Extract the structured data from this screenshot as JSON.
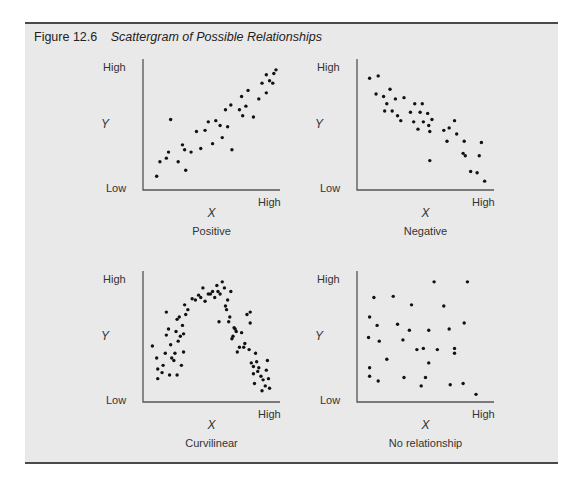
{
  "figure": {
    "number": "Figure 12.6",
    "title": "Scattergram of Possible Relationships",
    "colors": {
      "background": "#e9e9e9",
      "rule": "#4a4a4a",
      "dot": "#111111",
      "axis": "#555555"
    }
  },
  "chart_data": [
    {
      "type": "scatter",
      "title": "Positive",
      "xlabel": "X",
      "ylabel": "Y",
      "x_ticks": [
        "High"
      ],
      "y_ticks": [
        "High",
        "Low"
      ],
      "grid": false,
      "points": [
        [
          9,
          8
        ],
        [
          12,
          20
        ],
        [
          18,
          23
        ],
        [
          22,
          55
        ],
        [
          20,
          28
        ],
        [
          29,
          20
        ],
        [
          33,
          34
        ],
        [
          36,
          13
        ],
        [
          35,
          30
        ],
        [
          41,
          28
        ],
        [
          46,
          45
        ],
        [
          50,
          31
        ],
        [
          54,
          46
        ],
        [
          61,
          35
        ],
        [
          57,
          53
        ],
        [
          64,
          54
        ],
        [
          68,
          50
        ],
        [
          73,
          63
        ],
        [
          70,
          40
        ],
        [
          75,
          49
        ],
        [
          78,
          67
        ],
        [
          79,
          30
        ],
        [
          88,
          74
        ],
        [
          86,
          63
        ],
        [
          89,
          58
        ],
        [
          94,
          79
        ],
        [
          92,
          66
        ],
        [
          99,
          57
        ],
        [
          104,
          72
        ],
        [
          107,
          85
        ],
        [
          111,
          92
        ],
        [
          114,
          87
        ],
        [
          111,
          77
        ],
        [
          118,
          93
        ],
        [
          117,
          85
        ],
        [
          120,
          96
        ]
      ]
    },
    {
      "type": "scatter",
      "title": "Negative",
      "xlabel": "X",
      "ylabel": "Y",
      "x_ticks": [
        "High"
      ],
      "y_ticks": [
        "High",
        "Low"
      ],
      "grid": false,
      "points": [
        [
          8,
          89
        ],
        [
          16,
          91
        ],
        [
          14,
          76
        ],
        [
          21,
          74
        ],
        [
          27,
          80
        ],
        [
          32,
          72
        ],
        [
          24,
          68
        ],
        [
          22,
          62
        ],
        [
          40,
          73
        ],
        [
          29,
          62
        ],
        [
          34,
          58
        ],
        [
          37,
          54
        ],
        [
          50,
          68
        ],
        [
          46,
          61
        ],
        [
          57,
          68
        ],
        [
          49,
          53
        ],
        [
          55,
          61
        ],
        [
          58,
          53
        ],
        [
          53,
          47
        ],
        [
          62,
          60
        ],
        [
          66,
          55
        ],
        [
          63,
          50
        ],
        [
          64,
          45
        ],
        [
          77,
          46
        ],
        [
          82,
          48
        ],
        [
          87,
          54
        ],
        [
          80,
          37
        ],
        [
          89,
          43
        ],
        [
          96,
          37
        ],
        [
          95,
          27
        ],
        [
          97,
          25
        ],
        [
          112,
          36
        ],
        [
          110,
          25
        ],
        [
          64,
          21
        ],
        [
          102,
          12
        ],
        [
          108,
          11
        ],
        [
          115,
          4
        ]
      ]
    },
    {
      "type": "scatter",
      "title": "Curvilinear",
      "xlabel": "X",
      "ylabel": "Y",
      "x_ticks": [
        "High"
      ],
      "y_ticks": [
        "High",
        "Low"
      ],
      "grid": false,
      "points": [
        [
          5,
          43
        ],
        [
          9,
          33
        ],
        [
          10,
          16
        ],
        [
          10,
          24
        ],
        [
          14,
          21
        ],
        [
          15,
          27
        ],
        [
          17,
          37
        ],
        [
          18,
          52
        ],
        [
          18,
          71
        ],
        [
          20,
          57
        ],
        [
          21,
          19
        ],
        [
          22,
          44
        ],
        [
          23,
          33
        ],
        [
          25,
          31
        ],
        [
          26,
          37
        ],
        [
          27,
          55
        ],
        [
          28,
          19
        ],
        [
          28,
          65
        ],
        [
          29,
          47
        ],
        [
          30,
          67
        ],
        [
          31,
          51
        ],
        [
          32,
          27
        ],
        [
          33,
          60
        ],
        [
          34,
          38
        ],
        [
          34,
          53
        ],
        [
          35,
          77
        ],
        [
          36,
          69
        ],
        [
          38,
          73
        ],
        [
          42,
          82
        ],
        [
          45,
          81
        ],
        [
          48,
          85
        ],
        [
          50,
          83
        ],
        [
          52,
          91
        ],
        [
          54,
          80
        ],
        [
          57,
          86
        ],
        [
          59,
          86
        ],
        [
          61,
          88
        ],
        [
          63,
          83
        ],
        [
          65,
          93
        ],
        [
          66,
          88
        ],
        [
          67,
          63
        ],
        [
          68,
          86
        ],
        [
          70,
          96
        ],
        [
          72,
          91
        ],
        [
          73,
          76
        ],
        [
          74,
          73
        ],
        [
          75,
          81
        ],
        [
          76,
          63
        ],
        [
          77,
          67
        ],
        [
          78,
          88
        ],
        [
          79,
          49
        ],
        [
          80,
          51
        ],
        [
          81,
          58
        ],
        [
          82,
          57
        ],
        [
          83,
          55
        ],
        [
          84,
          38
        ],
        [
          86,
          42
        ],
        [
          88,
          54
        ],
        [
          90,
          42
        ],
        [
          91,
          45
        ],
        [
          93,
          69
        ],
        [
          95,
          40
        ],
        [
          96,
          62
        ],
        [
          96,
          71
        ],
        [
          97,
          29
        ],
        [
          99,
          26
        ],
        [
          99,
          20
        ],
        [
          100,
          12
        ],
        [
          101,
          37
        ],
        [
          102,
          30
        ],
        [
          103,
          22
        ],
        [
          104,
          25
        ],
        [
          106,
          18
        ],
        [
          107,
          6
        ],
        [
          108,
          15
        ],
        [
          110,
          10
        ],
        [
          111,
          23
        ],
        [
          112,
          31
        ],
        [
          113,
          16
        ],
        [
          114,
          8
        ]
      ]
    },
    {
      "type": "scatter",
      "title": "No relationship",
      "xlabel": "X",
      "ylabel": "Y",
      "x_ticks": [
        "High"
      ],
      "y_ticks": [
        "High",
        "Low"
      ],
      "grid": false,
      "points": [
        [
          12,
          83
        ],
        [
          30,
          84
        ],
        [
          47,
          77
        ],
        [
          68,
          96
        ],
        [
          77,
          76
        ],
        [
          99,
          96
        ],
        [
          8,
          67
        ],
        [
          15,
          60
        ],
        [
          34,
          61
        ],
        [
          45,
          56
        ],
        [
          63,
          56
        ],
        [
          82,
          57
        ],
        [
          96,
          62
        ],
        [
          7,
          50
        ],
        [
          17,
          47
        ],
        [
          39,
          48
        ],
        [
          52,
          40
        ],
        [
          58,
          41
        ],
        [
          71,
          40
        ],
        [
          87,
          41
        ],
        [
          87,
          37
        ],
        [
          24,
          32
        ],
        [
          63,
          29
        ],
        [
          8,
          25
        ],
        [
          8,
          18
        ],
        [
          16,
          14
        ],
        [
          40,
          17
        ],
        [
          60,
          17
        ],
        [
          56,
          10
        ],
        [
          83,
          11
        ],
        [
          95,
          12
        ],
        [
          107,
          3
        ]
      ]
    }
  ],
  "panels": [
    {
      "y_high": "High",
      "y_low": "Low",
      "x_high": "High",
      "x_var": "X",
      "y_var": "Y",
      "caption": "Positive"
    },
    {
      "y_high": "High",
      "y_low": "Low",
      "x_high": "High",
      "x_var": "X",
      "y_var": "Y",
      "caption": "Negative"
    },
    {
      "y_high": "High",
      "y_low": "Low",
      "x_high": "High",
      "x_var": "X",
      "y_var": "Y",
      "caption": "Curvilinear"
    },
    {
      "y_high": "High",
      "y_low": "Low",
      "x_high": "High",
      "x_var": "X",
      "y_var": "Y",
      "caption": "No relationship"
    }
  ]
}
